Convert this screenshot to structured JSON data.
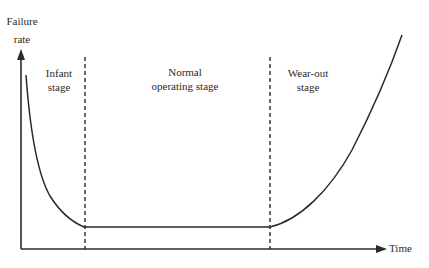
{
  "diagram": {
    "y_axis_label_line1": "Failure",
    "y_axis_label_line2": "rate",
    "x_axis_label": "Time",
    "stages": [
      {
        "line1": "Infant",
        "line2": "stage"
      },
      {
        "line1": "Normal",
        "line2": "operating stage"
      },
      {
        "line1": "Wear-out",
        "line2": "stage"
      }
    ],
    "colors": {
      "line": "#2a2a2a",
      "background": "#ffffff"
    }
  }
}
